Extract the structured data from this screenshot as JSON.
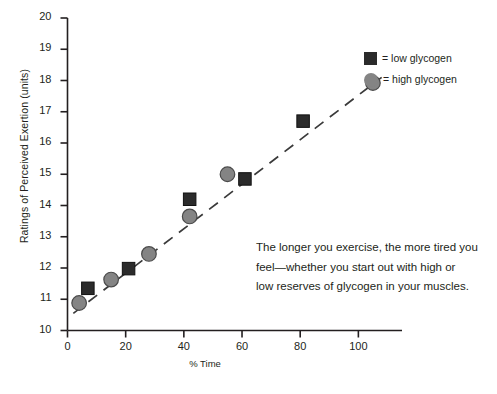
{
  "chart_data": {
    "type": "scatter",
    "title": "",
    "xlabel": "% Time",
    "ylabel": "Ratings of Perceived Exertion (units)",
    "xlim": [
      0,
      115
    ],
    "ylim": [
      10,
      20
    ],
    "xticks": [
      0,
      20,
      40,
      60,
      80,
      100
    ],
    "yticks": [
      10,
      11,
      12,
      13,
      14,
      15,
      16,
      17,
      18,
      19,
      20
    ],
    "grid": false,
    "legend_position": "top-right",
    "trendline": {
      "style": "dashed",
      "x": [
        2,
        108
      ],
      "y": [
        10.55,
        18.1
      ]
    },
    "series": [
      {
        "name": "low glycogen",
        "marker": "square",
        "color": "#2b2b2b",
        "points": [
          {
            "x": 7,
            "y": 11.35
          },
          {
            "x": 21,
            "y": 11.98
          },
          {
            "x": 42,
            "y": 14.2
          },
          {
            "x": 61,
            "y": 14.85
          },
          {
            "x": 81,
            "y": 16.7
          }
        ]
      },
      {
        "name": "high glycogen",
        "marker": "circle",
        "color": "#848484",
        "points": [
          {
            "x": 4,
            "y": 10.88
          },
          {
            "x": 15,
            "y": 11.63
          },
          {
            "x": 28,
            "y": 12.45
          },
          {
            "x": 42,
            "y": 13.65
          },
          {
            "x": 55,
            "y": 15.0
          },
          {
            "x": 105,
            "y": 17.92
          }
        ]
      }
    ]
  },
  "axis": {
    "y_label": "Ratings of Perceived Exertion (units)",
    "x_label": "% Time",
    "y_tick_labels": [
      "20",
      "19",
      "18",
      "17",
      "16",
      "15",
      "14",
      "13",
      "12",
      "11",
      "10"
    ],
    "x_tick_labels": [
      "0",
      "20",
      "40",
      "60",
      "80",
      "100"
    ]
  },
  "legend": {
    "items": [
      {
        "marker": "square-marker",
        "label": "= low glycogen"
      },
      {
        "marker": "circle-marker",
        "label": "= high glycogen"
      }
    ]
  },
  "annotation": {
    "line1": "The longer you exercise, the more tired you",
    "line2": "feel—whether you start out with high or",
    "line3": "low reserves of glycogen in your muscles."
  },
  "colors": {
    "square": "#2b2b2b",
    "circle": "#848484",
    "axis": "#231f20",
    "background": "#ffffff"
  }
}
